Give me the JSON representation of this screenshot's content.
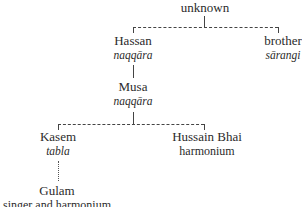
{
  "diagram": {
    "type": "family-tree",
    "nodes": {
      "root": {
        "name": "unknown"
      },
      "hassan": {
        "name": "Hassan",
        "role": "naqqāra"
      },
      "brother": {
        "name": "brother",
        "role": "sārangi"
      },
      "musa": {
        "name": "Musa",
        "role": "naqqāra"
      },
      "kasem": {
        "name": "Kasem",
        "role": "tabla"
      },
      "hussain": {
        "name": "Hussain Bhai",
        "role": "harmonium"
      },
      "gulam": {
        "name": "Gulam",
        "role": "singer and harmonium"
      }
    },
    "edges": [
      {
        "from": "root",
        "to": "hassan",
        "style": "dashed"
      },
      {
        "from": "root",
        "to": "brother",
        "style": "dashed"
      },
      {
        "from": "hassan",
        "to": "musa",
        "style": "solid"
      },
      {
        "from": "musa",
        "to": "kasem",
        "style": "dashed"
      },
      {
        "from": "musa",
        "to": "hussain",
        "style": "dashed"
      },
      {
        "from": "kasem",
        "to": "gulam",
        "style": "dotted"
      }
    ]
  }
}
